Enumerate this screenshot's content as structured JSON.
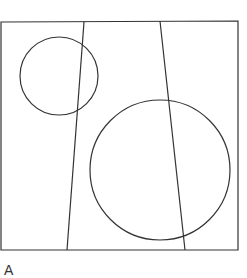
{
  "diagram": {
    "stroke_color": "#333333",
    "background": "#ffffff",
    "frame": {
      "x1": 1,
      "y1": 22,
      "x2": 238,
      "y2": 250
    },
    "lines": [
      {
        "name": "left-line",
        "x1": 84,
        "y1": 22,
        "x2": 67,
        "y2": 250
      },
      {
        "name": "right-line",
        "x1": 160,
        "y1": 21,
        "x2": 185,
        "y2": 250
      }
    ],
    "circles": [
      {
        "name": "small-circle",
        "cx": 59,
        "cy": 76,
        "r": 39
      },
      {
        "name": "large-circle",
        "cx": 160,
        "cy": 170,
        "r": 70
      }
    ],
    "label": "A"
  }
}
